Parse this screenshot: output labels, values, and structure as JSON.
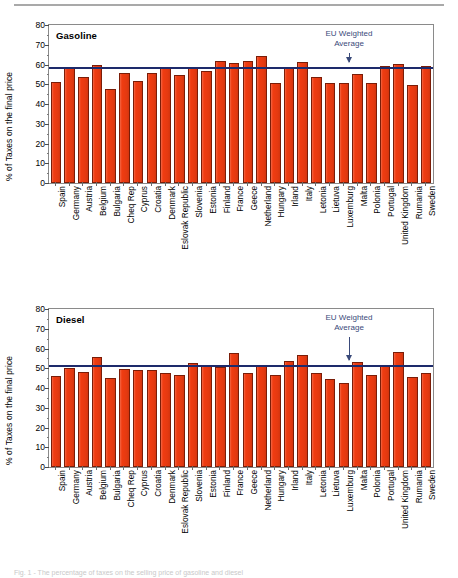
{
  "figure": {
    "top_rule": true,
    "caption": "Fig. 1 - The percentage of taxes on the selling price of gasoline and diesel"
  },
  "axis": {
    "ylabel": "% of Taxes on the final price",
    "yticks": [
      0,
      10,
      20,
      30,
      40,
      50,
      60,
      70,
      80
    ],
    "ylim": [
      0,
      80
    ]
  },
  "annotation": {
    "line1": "EU Weighted",
    "line2": "Average"
  },
  "colors": {
    "bar_fill": "#f03c11",
    "bar_edge": "#7a1d08",
    "average_line": "#1d2a6b",
    "annotation_text": "#3a4a7a",
    "frame": "#8a8a8a"
  },
  "countries": [
    "Spain",
    "Germany",
    "Austria",
    "Belgium",
    "Bulgaria",
    "Cheq Rep",
    "Cyprus",
    "Croatia",
    "Denmark",
    "Eslovak Republic",
    "Slovenia",
    "Estonia",
    "Finland",
    "France",
    "Geece",
    "Netherland",
    "Hungary",
    "Irland",
    "Italy",
    "Letonia",
    "Lietuva",
    "Luxemburg",
    "Malta",
    "Polonia",
    "Portugal",
    "United Kingdom",
    "Rumania",
    "Sweden"
  ],
  "chart_data": [
    {
      "type": "bar",
      "title": "Gasoline",
      "xlabel": "",
      "ylabel": "% of Taxes on the final price",
      "ylim": [
        0,
        80
      ],
      "yticks": [
        0,
        10,
        20,
        30,
        40,
        50,
        60,
        70,
        80
      ],
      "grid": false,
      "legend": "none",
      "categories": [
        "Spain",
        "Germany",
        "Austria",
        "Belgium",
        "Bulgaria",
        "Cheq Rep",
        "Cyprus",
        "Croatia",
        "Denmark",
        "Eslovak Republic",
        "Slovenia",
        "Estonia",
        "Finland",
        "France",
        "Geece",
        "Netherland",
        "Hungary",
        "Irland",
        "Italy",
        "Letonia",
        "Lietuva",
        "Luxemburg",
        "Malta",
        "Polonia",
        "Portugal",
        "United Kingdom",
        "Rumania",
        "Sweden"
      ],
      "values": [
        51.0,
        58.6,
        53.8,
        59.8,
        47.8,
        55.6,
        51.8,
        55.7,
        58.3,
        54.6,
        58.2,
        56.9,
        61.6,
        60.7,
        61.7,
        64.5,
        50.6,
        58.3,
        61.5,
        53.5,
        50.5,
        50.5,
        55.4,
        50.5,
        59.4,
        60.4,
        49.5,
        59.4
      ],
      "reference_line": {
        "label": "EU Weighted Average",
        "value": 58.6
      }
    },
    {
      "type": "bar",
      "title": "Diesel",
      "xlabel": "",
      "ylabel": "% of Taxes on the final price",
      "ylim": [
        0,
        80
      ],
      "yticks": [
        0,
        10,
        20,
        30,
        40,
        50,
        60,
        70,
        80
      ],
      "grid": false,
      "legend": "none",
      "categories": [
        "Spain",
        "Germany",
        "Austria",
        "Belgium",
        "Bulgaria",
        "Cheq Rep",
        "Cyprus",
        "Croatia",
        "Denmark",
        "Eslovak Republic",
        "Slovenia",
        "Estonia",
        "Finland",
        "France",
        "Geece",
        "Netherland",
        "Hungary",
        "Irland",
        "Italy",
        "Letonia",
        "Lietuva",
        "Luxemburg",
        "Malta",
        "Polonia",
        "Portugal",
        "United Kingdom",
        "Rumania",
        "Sweden"
      ],
      "values": [
        46.0,
        49.9,
        47.9,
        55.7,
        44.9,
        49.7,
        48.9,
        48.9,
        47.8,
        46.8,
        52.6,
        51.9,
        50.6,
        57.5,
        47.6,
        51.8,
        46.6,
        53.6,
        56.6,
        47.4,
        44.6,
        42.6,
        53.4,
        46.6,
        51.2,
        58.3,
        45.5,
        47.5
      ],
      "reference_line": {
        "label": "EU Weighted Average",
        "value": 51.8
      }
    }
  ]
}
